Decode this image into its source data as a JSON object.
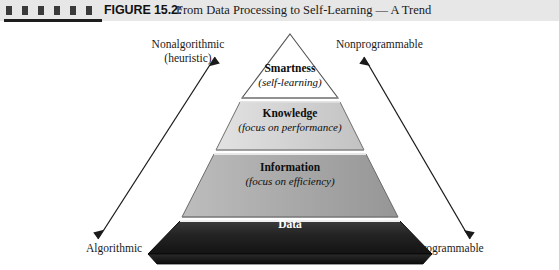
{
  "header": {
    "figure_label": "FIGURE 15.2:",
    "title": "From Data Processing to Self-Learning — A Trend",
    "band_color": "#e7e7e7",
    "tick_count": 6,
    "tick_color": "#3a3a3a",
    "rule_color": "#1d1d1d"
  },
  "diagram": {
    "type": "pyramid",
    "orientation": "apex-up",
    "tier_count": 4,
    "tiers": [
      {
        "name": "smartness",
        "title": "Smartness",
        "subtitle": "(self-learning)",
        "fill": "#ffffff",
        "text_color": "#0d0d0d",
        "level": 4
      },
      {
        "name": "knowledge",
        "title": "Knowledge",
        "subtitle": "(focus on performance)",
        "fill": "#d2d2d2",
        "text_color": "#0d0d0d",
        "level": 3
      },
      {
        "name": "information",
        "title": "Information",
        "subtitle": "(focus on efficiency)",
        "fill": "#a8a8a8",
        "text_color": "#0d0d0d",
        "level": 2
      },
      {
        "name": "data",
        "title": "Data",
        "subtitle": "",
        "fill": "#1f1f1f",
        "text_color": "#ffffff",
        "level": 1
      }
    ],
    "axis_labels": {
      "top_left_line1": "Nonalgorithmic",
      "top_left_line2": "(heuristic)",
      "top_right": "Nonprogrammable",
      "bottom_left": "Algorithmic",
      "bottom_right": "Programmable"
    },
    "arrows": [
      {
        "name": "left-trend-arrow",
        "direction": "double-headed",
        "from": "Algorithmic",
        "to": "Nonalgorithmic (heuristic)",
        "color": "#1a1a1a"
      },
      {
        "name": "right-trend-arrow",
        "direction": "double-headed",
        "from": "Programmable",
        "to": "Nonprogrammable",
        "color": "#1a1a1a"
      }
    ],
    "outline_color": "#4a4a4a",
    "background": "#ffffff"
  }
}
